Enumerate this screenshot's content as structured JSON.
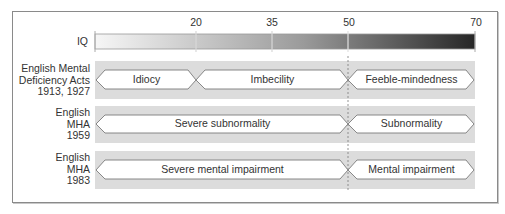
{
  "iq_scale": {
    "label": "IQ",
    "ticks": [
      {
        "value": 20,
        "label": "20"
      },
      {
        "value": 35,
        "label": "35"
      },
      {
        "value": 50,
        "label": "50"
      },
      {
        "value": 70,
        "label": "70"
      }
    ],
    "range": [
      0,
      70
    ],
    "gradient": [
      "#f4f4f4",
      "#2a2a2a"
    ]
  },
  "rows": [
    {
      "label_lines": [
        "English Mental",
        "Deficiency Acts",
        "1913, 1927"
      ],
      "segments": [
        {
          "label": "Idiocy",
          "from": 0,
          "to": 20
        },
        {
          "label": "Imbecility",
          "from": 20,
          "to": 50
        },
        {
          "label": "Feeble-mindedness",
          "from": 50,
          "to": 70
        }
      ]
    },
    {
      "label_lines": [
        "English",
        "MHA",
        "1959"
      ],
      "segments": [
        {
          "label": "Severe subnormality",
          "from": 0,
          "to": 50
        },
        {
          "label": "Subnormality",
          "from": 50,
          "to": 70
        }
      ]
    },
    {
      "label_lines": [
        "English",
        "MHA",
        "1983"
      ],
      "segments": [
        {
          "label": "Severe mental impairment",
          "from": 0,
          "to": 50
        },
        {
          "label": "Mental impairment",
          "from": 50,
          "to": 70
        }
      ]
    }
  ],
  "colors": {
    "band": "#dcdcdc",
    "arrow_fill": "#ffffff",
    "arrow_stroke": "#7a7a7a",
    "divider": "#7a7a7a"
  }
}
